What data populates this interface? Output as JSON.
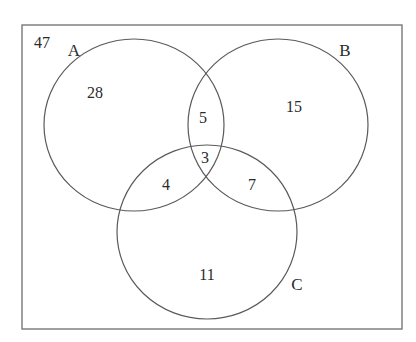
{
  "diagram": {
    "type": "venn-3",
    "universe_count": "47",
    "sets": [
      {
        "name": "A",
        "only": "28"
      },
      {
        "name": "B",
        "only": "15"
      },
      {
        "name": "C",
        "only": "11"
      }
    ],
    "regions": {
      "outside": "47",
      "A_only": "28",
      "B_only": "15",
      "C_only": "11",
      "A_and_B_only": "5",
      "A_and_C_only": "4",
      "B_and_C_only": "7",
      "A_and_B_and_C": "3"
    },
    "colors": {
      "line": "#5a5a5a",
      "text": "#2a2a2a",
      "background": "#ffffff"
    }
  }
}
